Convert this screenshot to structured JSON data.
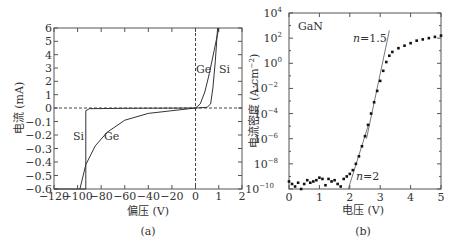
{
  "chart_data": [
    {
      "panel": "(a)",
      "type": "line",
      "xlabel": "偏压 (V)",
      "ylabel": "电流 (mA)",
      "x_ticks": [
        "-120",
        "-100",
        "-80",
        "-60",
        "-40",
        "-20",
        "0",
        "1",
        "2"
      ],
      "y_ticks": [
        "6",
        "5",
        "4",
        "3",
        "2",
        "1",
        "0",
        "-0.1",
        "-0.2",
        "-0.3",
        "-0.4",
        "-0.5",
        "-0.6"
      ],
      "xlim": [
        -120,
        2
      ],
      "ylim_positive": [
        0,
        6
      ],
      "ylim_negative": [
        -0.6,
        0
      ],
      "note": "split axes: reverse bias region -120..0 V and 0..-0.6 mA, forward region 0..2 V and 0..6 mA",
      "reference_lines": [
        "dashed horizontal at I=0",
        "dashed vertical at V=0"
      ],
      "series": [
        {
          "name": "Si",
          "reverse_breakdown_V": -93,
          "forward_turn_on_V": 0.6,
          "points_reverse": [
            [
              -120,
              -0.6
            ],
            [
              -93,
              -0.6
            ],
            [
              -93,
              -0.02
            ],
            [
              -90,
              -0.005
            ],
            [
              -60,
              -0.002
            ],
            [
              0,
              0
            ]
          ],
          "points_forward": [
            [
              0,
              0
            ],
            [
              0.5,
              0.05
            ],
            [
              0.65,
              0.3
            ],
            [
              0.75,
              1.5
            ],
            [
              0.85,
              3.5
            ],
            [
              0.95,
              6
            ]
          ]
        },
        {
          "name": "Ge",
          "soft_breakdown": true,
          "points_reverse": [
            [
              -98,
              -0.6
            ],
            [
              -93,
              -0.42
            ],
            [
              -85,
              -0.28
            ],
            [
              -75,
              -0.18
            ],
            [
              -60,
              -0.09
            ],
            [
              -40,
              -0.04
            ],
            [
              -20,
              -0.02
            ],
            [
              0,
              0
            ]
          ],
          "points_forward": [
            [
              0,
              0
            ],
            [
              0.2,
              0.3
            ],
            [
              0.4,
              1.2
            ],
            [
              0.6,
              2.6
            ],
            [
              0.8,
              4.3
            ],
            [
              1.0,
              6
            ]
          ]
        }
      ],
      "annotations": [
        "Ge",
        "Si",
        "Si",
        "Ge"
      ],
      "caption": "(a)"
    },
    {
      "panel": "(b)",
      "type": "scatter",
      "title_in_plot": "GaN",
      "xlabel": "电压 (V)",
      "ylabel": "电流密度 (A·cm⁻²)",
      "x_ticks": [
        "0",
        "1",
        "2",
        "3",
        "4",
        "5"
      ],
      "y_ticks": [
        "10^4",
        "10^2",
        "10^0",
        "10^-2",
        "10^-4",
        "10^-6",
        "10^-8",
        "10^-10"
      ],
      "xlim": [
        0,
        5
      ],
      "ylim_log10": [
        -10,
        4
      ],
      "yscale": "log",
      "series": [
        {
          "name": "GaN data",
          "points_log10": [
            [
              0.0,
              -9.4
            ],
            [
              0.1,
              -9.6
            ],
            [
              0.2,
              -9.8
            ],
            [
              0.3,
              -9.5
            ],
            [
              0.4,
              -10.0
            ],
            [
              0.5,
              -9.6
            ],
            [
              0.6,
              -9.3
            ],
            [
              0.7,
              -9.5
            ],
            [
              0.8,
              -9.4
            ],
            [
              0.9,
              -9.3
            ],
            [
              1.0,
              -9.1
            ],
            [
              1.1,
              -9.2
            ],
            [
              1.2,
              -9.7
            ],
            [
              1.3,
              -9.2
            ],
            [
              1.4,
              -9.4
            ],
            [
              1.5,
              -9.3
            ],
            [
              1.6,
              -9.6
            ],
            [
              1.7,
              -9.8
            ],
            [
              1.8,
              -9.2
            ],
            [
              1.9,
              -9.0
            ],
            [
              2.0,
              -8.8
            ],
            [
              2.1,
              -8.5
            ],
            [
              2.2,
              -8.0
            ],
            [
              2.3,
              -7.4
            ],
            [
              2.4,
              -6.6
            ],
            [
              2.5,
              -5.8
            ],
            [
              2.6,
              -4.9
            ],
            [
              2.7,
              -4.0
            ],
            [
              2.8,
              -3.1
            ],
            [
              2.9,
              -2.2
            ],
            [
              3.0,
              -1.4
            ],
            [
              3.1,
              -0.6
            ],
            [
              3.2,
              0.1
            ],
            [
              3.3,
              0.6
            ],
            [
              3.4,
              0.9
            ],
            [
              3.6,
              1.2
            ],
            [
              3.8,
              1.4
            ],
            [
              4.0,
              1.6
            ],
            [
              4.2,
              1.8
            ],
            [
              4.4,
              1.9
            ],
            [
              4.6,
              2.0
            ],
            [
              4.8,
              2.1
            ],
            [
              5.0,
              2.2
            ]
          ]
        },
        {
          "name": "fit n=1.5",
          "line_log10": [
            [
              2.55,
              -6.0
            ],
            [
              3.3,
              2.6
            ]
          ]
        },
        {
          "name": "fit n=2",
          "line_log10": [
            [
              1.95,
              -10.0
            ],
            [
              2.6,
              -5.0
            ]
          ]
        }
      ],
      "annotations": [
        "GaN",
        "n=1.5",
        "n=2"
      ],
      "caption": "(b)"
    }
  ],
  "panel_a": {
    "ylabel": "电流 (mA)",
    "xlabel": "偏压 (V)",
    "caption": "(a)",
    "labels": {
      "ge_top": "Ge",
      "si_top": "Si",
      "si_bottom": "Si",
      "ge_bottom": "Ge"
    }
  },
  "panel_b": {
    "ylabel": "电流密度 (A·cm",
    "ylabel_sup": "−2",
    "ylabel_end": ")",
    "xlabel": "电压 (V)",
    "caption": "(b)",
    "title": "GaN",
    "n15": "=1.5",
    "n2": "=2",
    "n": "n"
  }
}
